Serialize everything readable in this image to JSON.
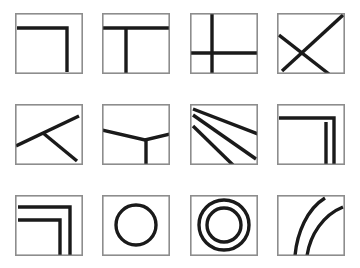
{
  "figure": {
    "title": "",
    "kind": "line-drawing-grid",
    "background_color": "#ffffff",
    "frame_color": "#8d8d8d",
    "stroke_color": "#1a1a1a",
    "columns": 4,
    "rows": 3,
    "tile_count": 12
  },
  "tiles": [
    {
      "index": 1,
      "name": "corner-bracket-single",
      "description": "Horizontal line near top joining a vertical line near right, forming an inverted L corner",
      "x": 15,
      "y": 13,
      "w": 68,
      "h": 61,
      "paths": [
        "M 2 15 L 52 15 L 52 59"
      ]
    },
    {
      "index": 2,
      "name": "t-junction-down",
      "description": "Horizontal line near top across full width with a vertical line dropping from it to the bottom",
      "x": 102,
      "y": 13,
      "w": 68,
      "h": 61,
      "paths": [
        "M 1 15 L 67 15",
        "M 24 15 L 24 61"
      ]
    },
    {
      "index": 3,
      "name": "cross-plus",
      "description": "Vertical line left of center crossing a horizontal line below center, forming a plus",
      "x": 190,
      "y": 13,
      "w": 68,
      "h": 61,
      "paths": [
        "M 22 0 L 22 61",
        "M 0 40 L 68 40"
      ]
    },
    {
      "index": 4,
      "name": "x-cross-diagonals",
      "description": "Two crossing diagonals forming an X; one runs bottom-left to top-right, the other from left edge to bottom-right",
      "x": 277,
      "y": 13,
      "w": 68,
      "h": 61,
      "paths": [
        "M 5 58 L 66 2",
        "M 2 22 L 52 61"
      ]
    },
    {
      "index": 5,
      "name": "arrow-chevron-left",
      "description": "Two lines meeting near the left-center, one rising to the top-right, one falling to the bottom-right",
      "x": 15,
      "y": 104,
      "w": 68,
      "h": 61,
      "paths": [
        "M 1 42 L 64 12",
        "M 28 29 L 62 57"
      ]
    },
    {
      "index": 6,
      "name": "y-junction-shallow-v",
      "description": "Shallow V spanning left edge to right edge with a vertical stem dropping from the vertex to the bottom",
      "x": 102,
      "y": 104,
      "w": 68,
      "h": 61,
      "paths": [
        "M 0 26 L 43 36 L 68 30",
        "M 44 36 L 44 61"
      ]
    },
    {
      "index": 7,
      "name": "fan-rays-three",
      "description": "Three straight rays fanning out from the top-left corner toward the right and bottom edges",
      "x": 190,
      "y": 104,
      "w": 68,
      "h": 61,
      "paths": [
        "M 3 5 L 68 30",
        "M 3 11 L 66 55",
        "M 3 22 L 43 61"
      ]
    },
    {
      "index": 8,
      "name": "corner-bracket-double-vertical",
      "description": "Inverted L corner whose vertical leg is doubled into two parallel lines on the right",
      "x": 277,
      "y": 104,
      "w": 68,
      "h": 61,
      "paths": [
        "M 2 14 L 57 14 L 57 61",
        "M 49 18 L 49 61"
      ]
    },
    {
      "index": 9,
      "name": "corner-bracket-nested-double",
      "description": "Two nested inverted L corner brackets, offset from each other",
      "x": 15,
      "y": 195,
      "w": 68,
      "h": 61,
      "paths": [
        "M 3 12 L 55 12 L 55 61",
        "M 3 25 L 45 25 L 45 61"
      ]
    },
    {
      "index": 10,
      "name": "circle-single",
      "description": "A single bold circle centered in the tile",
      "x": 102,
      "y": 195,
      "w": 68,
      "h": 61,
      "circles": [
        {
          "cx": 34,
          "cy": 30,
          "r": 20
        }
      ]
    },
    {
      "index": 11,
      "name": "circle-concentric-double",
      "description": "Two concentric circles, an outer ring and an inner ring",
      "x": 190,
      "y": 195,
      "w": 68,
      "h": 61,
      "circles": [
        {
          "cx": 34,
          "cy": 30,
          "r": 25
        },
        {
          "cx": 34,
          "cy": 30,
          "r": 17
        }
      ]
    },
    {
      "index": 12,
      "name": "curves-parallel-arcs",
      "description": "Two parallel curved arcs sweeping from the bottom edge upward to the top-right",
      "x": 277,
      "y": 195,
      "w": 68,
      "h": 61,
      "paths": [
        "M 18 61 C 20 38 30 14 48 3",
        "M 30 61 C 33 40 46 20 66 12"
      ]
    }
  ]
}
